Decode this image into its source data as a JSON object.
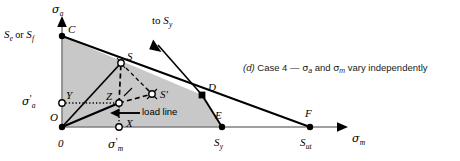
{
  "figure": {
    "caption": {
      "marker": "(d)",
      "text_before": "Case 4 —",
      "sigma_a": "σ",
      "sigma_a_sub": "a",
      "text_mid": "and",
      "sigma_m": "σ",
      "sigma_m_sub": "m",
      "text_after": "vary independently",
      "full": "(d) Case 4 — σa and σm vary independently"
    },
    "axes": {
      "y_axis_label": "σ",
      "y_axis_sub": "a",
      "x_axis_label": "σ",
      "x_axis_sub": "m",
      "origin_label": "0"
    },
    "annotations": {
      "endurance_limit": "S",
      "endurance_limit_sub": "e",
      "or_text": "or",
      "fatigue_strength": "S",
      "fatigue_strength_sub": "f",
      "to_sy_text": "to",
      "to_sy_symbol": "S",
      "to_sy_sub": "y",
      "load_line": "load line",
      "sigma_a_prime": "σ",
      "sigma_a_prime_sub": "a",
      "sigma_a_prime_mark": "'",
      "sigma_m_prime": "σ",
      "sigma_m_prime_sub": "m",
      "sigma_m_prime_mark": "'"
    },
    "points": [
      {
        "id": "C",
        "label": "C",
        "x": 62,
        "y": 36,
        "marker": "filled-circle"
      },
      {
        "id": "S",
        "label": "S",
        "x": 121,
        "y": 63,
        "marker": "open-circle"
      },
      {
        "id": "Sp",
        "label": "S'",
        "x": 152,
        "y": 94,
        "marker": "open-circle"
      },
      {
        "id": "D",
        "label": "D",
        "x": 202,
        "y": 95,
        "marker": "filled-square"
      },
      {
        "id": "E",
        "label": "E",
        "x": 222,
        "y": 127,
        "marker": "filled-circle"
      },
      {
        "id": "F",
        "label": "F",
        "x": 310,
        "y": 127,
        "marker": "filled-circle"
      },
      {
        "id": "Y",
        "label": "Y",
        "x": 62,
        "y": 103,
        "marker": "open-circle"
      },
      {
        "id": "Z",
        "label": "Z",
        "x": 119,
        "y": 103,
        "marker": "open-circle"
      },
      {
        "id": "X",
        "label": "X",
        "x": 119,
        "y": 127,
        "marker": "open-circle"
      },
      {
        "id": "O",
        "label": "O",
        "x": 62,
        "y": 127,
        "marker": "filled-circle"
      }
    ],
    "axis_ticks": {
      "x_sy": "S",
      "x_sy_sub": "y",
      "x_sut": "S",
      "x_sut_sub": "ut"
    },
    "colors": {
      "shade_fill": "#c8c8c8",
      "line": "#000000",
      "axis": "#7a7a7a",
      "background": "#ffffff"
    }
  }
}
